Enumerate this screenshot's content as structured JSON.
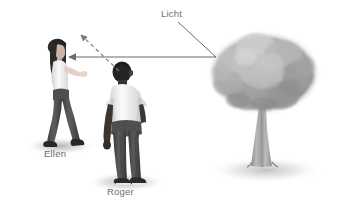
{
  "scene": {
    "width": 337,
    "height": 208,
    "background_color": "#ffffff",
    "description": "Optics diagram: light from a tree travels to Roger, dashed sight line from Roger toward upper left, solid arrow pointing to Ellen"
  },
  "labels": {
    "light": "Licht",
    "person_left": "Ellen",
    "person_right": "Roger"
  },
  "colors": {
    "label_text": "#6e6e6e",
    "arrow_line": "#6b6b6b",
    "dashed_line": "#8a8a8a",
    "shadow": "#c9c9c9",
    "tree_canopy_light": "#c2c2c2",
    "tree_canopy_dark": "#8e8e8e",
    "tree_trunk": "#a3a3a3",
    "skin_light": "#d8c6bb",
    "skin_dark": "#3b3330",
    "shirt_white": "#f2f2f2",
    "jeans_dark": "#4a4a4a",
    "hair_dark": "#2b2b2b"
  },
  "arrows": {
    "solid_ray": {
      "name": "light-ray-to-ellen",
      "from_x": 216,
      "from_y": 57,
      "to_x": 66,
      "to_y": 57,
      "style": "solid",
      "arrowhead": "left"
    },
    "dashed_ray": {
      "name": "sight-line-dashed",
      "from_x": 119,
      "from_y": 71,
      "to_x": 78,
      "to_y": 32,
      "style": "dashed",
      "arrowhead": "upper-left"
    },
    "leader": {
      "name": "licht-leader-line",
      "from_x": 178,
      "from_y": 22,
      "to_x": 216,
      "to_y": 57,
      "style": "solid",
      "arrowhead": "none"
    }
  },
  "figures": {
    "ellen": {
      "name": "person-ellen",
      "x": 36,
      "y": 48,
      "width": 48,
      "height": 100,
      "facing": "left",
      "hair": "long dark",
      "top": "white sleeveless",
      "bottom": "dark jeans"
    },
    "roger": {
      "name": "person-roger",
      "x": 100,
      "y": 62,
      "width": 52,
      "height": 122,
      "facing": "away",
      "hair": "short dark",
      "top": "white t-shirt",
      "bottom": "dark jeans"
    },
    "tree": {
      "name": "tree",
      "x": 212,
      "y": 38,
      "width": 112,
      "height": 140,
      "canopy": "rounded broad",
      "trunk": "tapered"
    }
  }
}
